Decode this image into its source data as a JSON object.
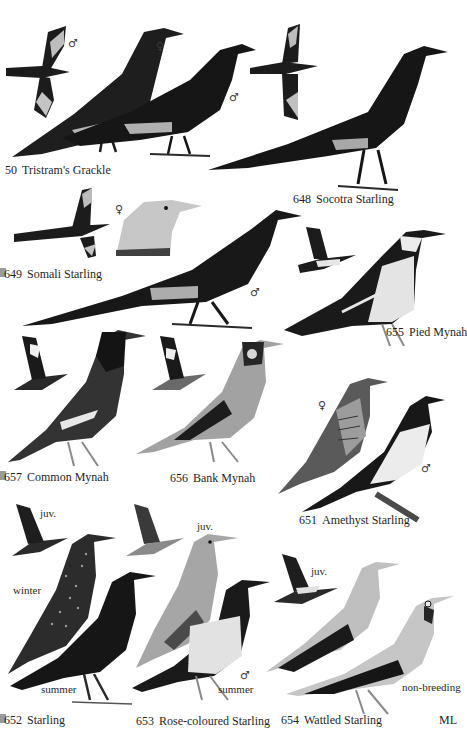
{
  "plate": {
    "artist_initials": "ML",
    "species": [
      {
        "number": "50",
        "name": "Tristram's Grackle",
        "sex_marks": [
          "♂",
          "♀",
          "♂"
        ]
      },
      {
        "number": "648",
        "name": "Socotra Starling"
      },
      {
        "number": "649",
        "name": "Somali Starling",
        "sex_marks": [
          "♀",
          "♂"
        ]
      },
      {
        "number": "655",
        "name": "Pied Mynah"
      },
      {
        "number": "657",
        "name": "Common Mynah"
      },
      {
        "number": "656",
        "name": "Bank Mynah"
      },
      {
        "number": "651",
        "name": "Amethyst Starling",
        "sex_marks": [
          "♀",
          "♂"
        ]
      },
      {
        "number": "652",
        "name": "Starling",
        "notes": [
          "juv.",
          "winter",
          "summer"
        ]
      },
      {
        "number": "653",
        "name": "Rose-coloured Starling",
        "notes": [
          "juv.",
          "summer"
        ],
        "sex_marks": [
          "♂"
        ]
      },
      {
        "number": "654",
        "name": "Wattled Starling",
        "notes": [
          "juv.",
          "non-breeding"
        ]
      }
    ]
  },
  "palette": {
    "black_plumage": "#1c1c1c",
    "dark_grey": "#3a3a3a",
    "mid_grey": "#7a7a7a",
    "light_grey": "#b8b8b8",
    "pale": "#dedede",
    "background": "#ffffff"
  }
}
